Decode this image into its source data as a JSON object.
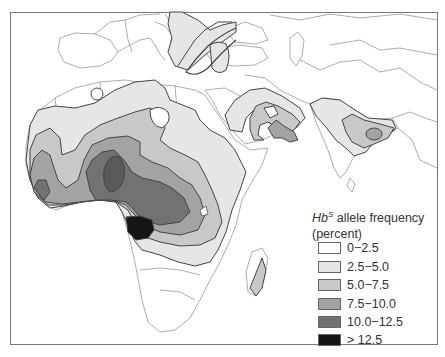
{
  "map": {
    "subject": "Hemoglobin S (sickle cell) allele frequency distribution",
    "region_shown": "Africa, Southern Europe, Middle East, South Asia"
  },
  "legend": {
    "title_italic": "Hb",
    "title_superscript": "S",
    "title_rest": " allele frequency",
    "subtitle": "(percent)",
    "items": [
      {
        "label": "0−2.5",
        "color": "#ffffff"
      },
      {
        "label": "2.5−5.0",
        "color": "#e6e6e6"
      },
      {
        "label": "5.0−7.5",
        "color": "#c8c8c8"
      },
      {
        "label": "7.5−10.0",
        "color": "#a3a3a3"
      },
      {
        "label": "10.0−12.5",
        "color": "#727272"
      },
      {
        "label": "> 12.5",
        "color": "#151515"
      }
    ]
  }
}
